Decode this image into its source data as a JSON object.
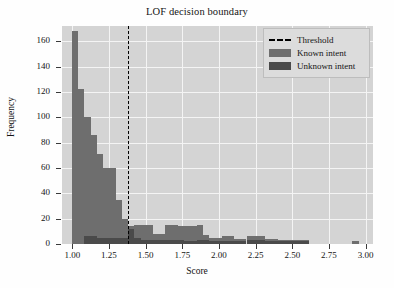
{
  "chart_data": {
    "type": "bar",
    "title": "LOF decision boundary",
    "xlabel": "Score",
    "ylabel": "Frequency",
    "xlim": [
      0.93,
      3.05
    ],
    "ylim": [
      0,
      172
    ],
    "grid": true,
    "legend_position": "upper right",
    "xticks": [
      "1.00",
      "1.25",
      "1.50",
      "1.75",
      "2.00",
      "2.25",
      "2.50",
      "2.75",
      "3.00"
    ],
    "xtick_values": [
      1.0,
      1.25,
      1.5,
      1.75,
      2.0,
      2.25,
      2.5,
      2.75,
      3.0
    ],
    "yticks": [
      "0",
      "20",
      "40",
      "60",
      "80",
      "100",
      "120",
      "140",
      "160"
    ],
    "ytick_values": [
      0,
      20,
      40,
      60,
      80,
      100,
      120,
      140,
      160
    ],
    "bin_width": 0.0425,
    "annotations": [
      {
        "name": "threshold-line",
        "label": "Threshold",
        "x": 1.38,
        "style": "dashed",
        "color": "#000000"
      }
    ],
    "series": [
      {
        "name": "Known intent",
        "color": "#6e6e6e",
        "bins": [
          0.998,
          1.04,
          1.083,
          1.125,
          1.168,
          1.21,
          1.253,
          1.295,
          1.338,
          1.38,
          1.423,
          1.465,
          1.508,
          1.55,
          1.593,
          1.635,
          1.678,
          1.72,
          1.763,
          1.805,
          1.848,
          1.89,
          1.933,
          1.975,
          2.018,
          2.06,
          2.103,
          2.145,
          2.188,
          2.23,
          2.273,
          2.315,
          2.358,
          2.4,
          2.443,
          2.485,
          2.528,
          2.57,
          2.91
        ],
        "values": [
          168,
          122,
          100,
          86,
          71,
          60,
          60,
          35,
          20,
          14,
          15,
          15,
          15,
          8,
          8,
          15,
          15,
          14,
          14,
          14,
          15,
          7,
          5,
          5,
          6,
          6,
          4,
          4,
          6,
          6,
          6,
          4,
          4,
          3,
          3,
          3,
          3,
          3,
          2
        ]
      },
      {
        "name": "Unknown intent",
        "color": "#4a4a4a",
        "bins": [
          1.083,
          1.125,
          1.168,
          1.21,
          1.253,
          1.295,
          1.338,
          1.38,
          1.423,
          1.465,
          1.508,
          1.55,
          1.593,
          1.635,
          1.678,
          1.72,
          1.763,
          1.805,
          1.848,
          1.89,
          1.933,
          1.975,
          2.018,
          2.06,
          2.103,
          2.145,
          2.188,
          2.23,
          2.273,
          2.315,
          2.358,
          2.4,
          2.443,
          2.485,
          2.528,
          2.57
        ],
        "values": [
          6,
          6,
          5,
          5,
          5,
          5,
          5,
          12,
          5,
          3,
          3,
          3,
          3,
          3,
          3,
          3,
          2,
          2,
          3,
          3,
          2,
          2,
          2,
          2,
          2,
          2,
          3,
          3,
          3,
          2,
          2,
          2,
          2,
          2,
          2,
          2
        ]
      }
    ],
    "legend_entries": [
      {
        "label": "Threshold",
        "key": "dashed-line",
        "color": "#000000"
      },
      {
        "label": "Known intent",
        "key": "patch",
        "color": "#6e6e6e"
      },
      {
        "label": "Unknown intent",
        "key": "patch",
        "color": "#4a4a4a"
      }
    ]
  }
}
